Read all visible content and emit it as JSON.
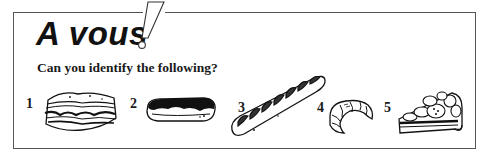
{
  "header": {
    "title": "A vous",
    "exclamation": "!"
  },
  "prompt": "Can you identify the following?",
  "items": [
    {
      "number": "1",
      "icon": "lasagne-icon"
    },
    {
      "number": "2",
      "icon": "eclair-icon"
    },
    {
      "number": "3",
      "icon": "baguette-icon"
    },
    {
      "number": "4",
      "icon": "croissant-icon"
    },
    {
      "number": "5",
      "icon": "fruit-tart-slice-icon"
    }
  ],
  "colors": {
    "ink": "#111111",
    "border": "#555555",
    "background": "#ffffff"
  }
}
